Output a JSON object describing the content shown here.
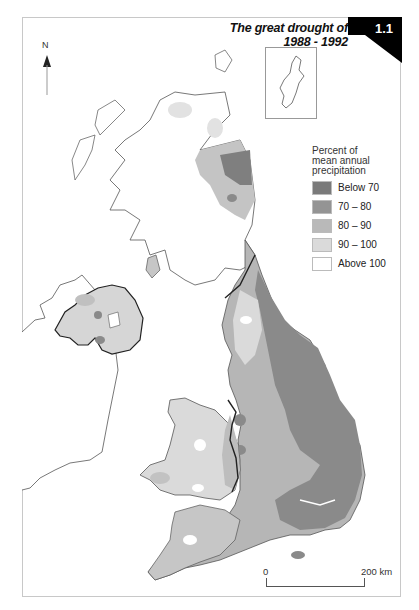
{
  "title": "The great drought of 1988 - 1992",
  "figure_number": "1.1",
  "north_arrow": {
    "label": "N"
  },
  "legend": {
    "title_lines": [
      "Percent of",
      "mean annual",
      "precipitation"
    ],
    "items": [
      {
        "label": "Below 70",
        "color": "#7a7a7a"
      },
      {
        "label": "70 – 80",
        "color": "#949494"
      },
      {
        "label": "80 – 90",
        "color": "#b9b9b9"
      },
      {
        "label": "90 – 100",
        "color": "#dadada"
      },
      {
        "label": "Above 100",
        "color": "#ffffff"
      }
    ]
  },
  "scale_bar": {
    "start": "0",
    "end": "200 km"
  },
  "inset": {
    "name": "Shetland Islands"
  },
  "colors": {
    "coast": "#555555",
    "border": "#222222",
    "badge": "#000000"
  }
}
